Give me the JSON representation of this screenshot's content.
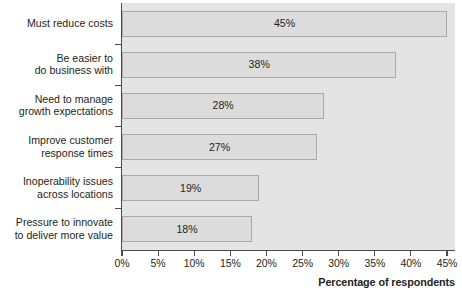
{
  "chart_data": {
    "type": "bar",
    "orientation": "horizontal",
    "title": "",
    "xlabel": "Percentage of respondents",
    "ylabel": "",
    "xlim": [
      0,
      45
    ],
    "xtick_values": [
      0,
      5,
      10,
      15,
      20,
      25,
      30,
      35,
      40,
      45
    ],
    "xtick_labels": [
      "0%",
      "5%",
      "10%",
      "15%",
      "20%",
      "25%",
      "30%",
      "35%",
      "40%",
      "45%"
    ],
    "grid": false,
    "legend": null,
    "categories": [
      "Must reduce costs",
      "Be easier to do business with",
      "Need to manage growth expectations",
      "Improve customer response times",
      "Inoperability issues across locations",
      "Pressure to innovate to deliver more value"
    ],
    "category_lines": [
      [
        "Must reduce costs"
      ],
      [
        "Be easier to",
        "do business with"
      ],
      [
        "Need to manage",
        "growth expectations"
      ],
      [
        "Improve customer",
        "response times"
      ],
      [
        "Inoperability issues",
        "across locations"
      ],
      [
        "Pressure to innovate",
        "to deliver more value"
      ]
    ],
    "values": [
      45,
      38,
      28,
      27,
      19,
      18
    ],
    "data_labels": [
      "45%",
      "38%",
      "28%",
      "27%",
      "19%",
      "18%"
    ],
    "colors": {
      "plot_background": "#e4e4e4",
      "bar_fill": "#dcdcdc",
      "bar_border": "#a9a9a9",
      "axis": "#4a4a4a",
      "text": "#231f20",
      "page_background": "#ffffff"
    }
  }
}
